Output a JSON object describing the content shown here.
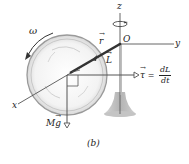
{
  "figure": {
    "caption": "(b)",
    "axes": {
      "z": "z",
      "y": "y",
      "x": "x",
      "origin": "O"
    },
    "labels": {
      "omega": "ω",
      "r": "r",
      "L": "L",
      "tau": "τ",
      "equals": "=",
      "dL": "dL",
      "dt": "dt",
      "Mg_M": "M",
      "Mg_g": "g"
    },
    "colors": {
      "line": "#555555",
      "wheel_rim": "#999999",
      "wheel_fill": "#f2f2f2",
      "rod": "#333333",
      "stand": "#bdbdbd",
      "text": "#222222"
    }
  }
}
